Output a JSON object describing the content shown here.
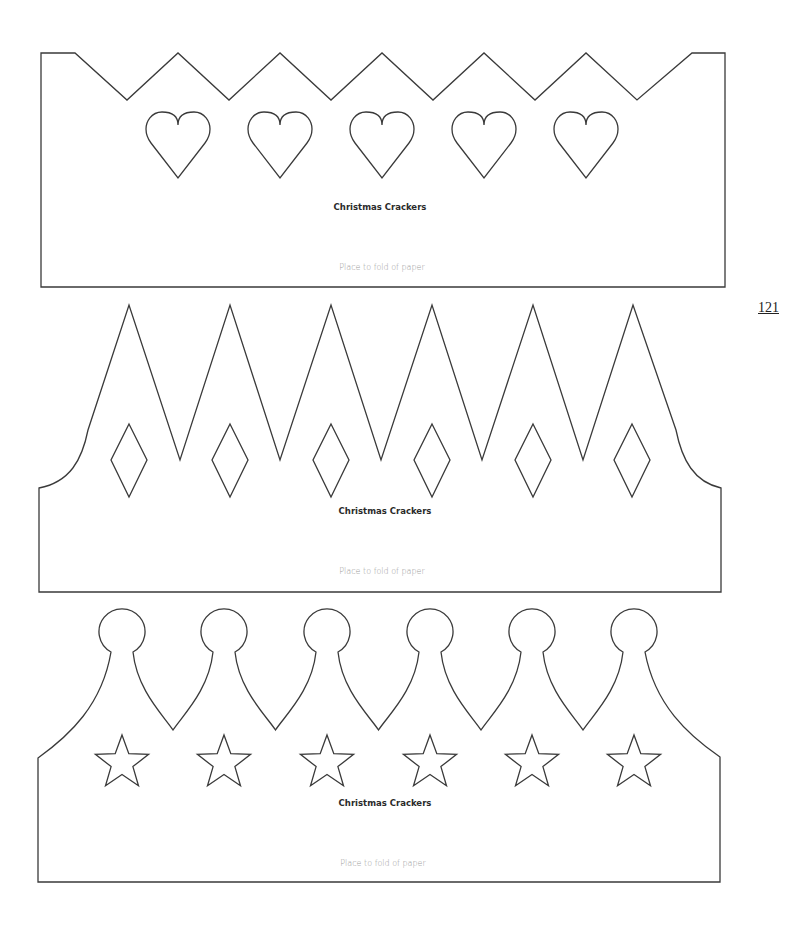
{
  "page_number": "121",
  "crowns": [
    {
      "style": "zigzag-with-hearts",
      "cutout": "heart-icon",
      "cutout_count": 5,
      "title": "Christmas Crackers",
      "fold_label": "Place to fold of paper"
    },
    {
      "style": "tall-points-with-diamonds",
      "cutout": "diamond-icon",
      "cutout_count": 6,
      "title": "Christmas Crackers",
      "fold_label": "Place to fold of paper"
    },
    {
      "style": "ball-points-with-stars",
      "cutout": "star-icon",
      "cutout_count": 6,
      "title": "Christmas Crackers",
      "fold_label": "Place to fold of paper"
    }
  ],
  "colors": {
    "line": "#3a3a3a",
    "text": "#2a2a2a",
    "fold_text": "#9a9a9a"
  }
}
